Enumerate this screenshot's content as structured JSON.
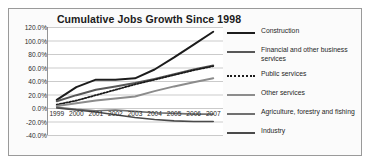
{
  "chart_data": {
    "type": "line",
    "title": "Cumulative Jobs Growth Since 1998",
    "xlabel": "",
    "ylabel": "",
    "x": [
      "1999",
      "2000",
      "2001",
      "2002",
      "2003",
      "2004",
      "2005",
      "2006",
      "2007"
    ],
    "categories": [
      "1999",
      "2000",
      "2001",
      "2002",
      "2003",
      "2004",
      "2005",
      "2006",
      "2007"
    ],
    "ylim": [
      -40,
      120
    ],
    "yticks": [
      120,
      100,
      80,
      60,
      40,
      20,
      0,
      -20,
      -40
    ],
    "ytick_labels": [
      "120.0%",
      "100.0%",
      "80.0%",
      "60.0%",
      "40.0%",
      "20.0%",
      "0.0%",
      "-20.0%",
      "-40.0%"
    ],
    "grid": true,
    "legend_position": "right",
    "series": [
      {
        "name": "Construction",
        "color": "#1c1c1c",
        "style": "solid",
        "width": 2.0,
        "values": [
          12,
          31,
          42,
          42,
          44,
          57,
          75,
          94,
          113
        ]
      },
      {
        "name": "Financial and other business services",
        "color": "#585858",
        "style": "solid",
        "width": 2.0,
        "values": [
          10,
          19,
          27,
          32,
          37,
          43,
          50,
          57,
          63
        ]
      },
      {
        "name": "Public services",
        "color": "#1c1c1c",
        "style": "dotted",
        "width": 1.8,
        "values": [
          5,
          11,
          19,
          27,
          35,
          42,
          49,
          56,
          62
        ]
      },
      {
        "name": "Other services",
        "color": "#8c8c8c",
        "style": "solid",
        "width": 2.0,
        "values": [
          3,
          7,
          11,
          14,
          17,
          25,
          32,
          38,
          44
        ]
      },
      {
        "name": "Agriculture, forestry and fishing",
        "color": "#707070",
        "style": "solid",
        "width": 1.6,
        "values": [
          1,
          -2,
          -4,
          -3,
          -5,
          -7,
          -8,
          -9,
          -9
        ]
      },
      {
        "name": "Industry",
        "color": "#4a4a4a",
        "style": "solid",
        "width": 1.6,
        "values": [
          0,
          -3,
          -6,
          -10,
          -14,
          -17,
          -19,
          -20,
          -20
        ]
      }
    ]
  },
  "legend": {
    "items": [
      {
        "label": "Construction"
      },
      {
        "label": "Financial and other business services"
      },
      {
        "label": "Public services"
      },
      {
        "label": "Other services"
      },
      {
        "label": "Agriculture, forestry and fishing"
      },
      {
        "label": "Industry"
      }
    ]
  },
  "colors": {
    "plot_background": "#fbfbfb",
    "frame_border": "#9a9a9a",
    "gridline": "#b5b5b5",
    "axis": "#7a7a7a",
    "text": "#1f1f1f"
  }
}
